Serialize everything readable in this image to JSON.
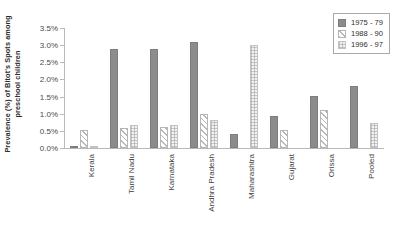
{
  "chart_data": {
    "type": "bar",
    "title": "",
    "xlabel": "",
    "ylabel": "Prevalence (%) of Bitot's Spots among\npreschool children",
    "ylim": [
      0,
      3.5
    ],
    "ytick_labels": [
      "0.0%",
      "0.5%",
      "1.0%",
      "1.5%",
      "2.0%",
      "2.5%",
      "3.0%",
      "3.5%"
    ],
    "ytick_values": [
      0,
      0.5,
      1.0,
      1.5,
      2.0,
      2.5,
      3.0,
      3.5
    ],
    "grid": false,
    "legend_position": "top-right",
    "categories": [
      "Kerala",
      "Tamil Nadu",
      "Karnataka",
      "Andhra Pradesh",
      "Maharashtra",
      "Gujarat",
      "Orissa",
      "Pooled"
    ],
    "series": [
      {
        "name": "1975 - 79",
        "color": "#8c8c8c",
        "fill": "solid-gray",
        "values": [
          0.07,
          2.89,
          2.9,
          3.1,
          0.4,
          0.92,
          1.51,
          1.82
        ]
      },
      {
        "name": "1988 - 90",
        "color": "#ffffff",
        "fill": "diagonal-hatch",
        "values": [
          0.52,
          0.59,
          0.6,
          1.0,
          0.0,
          0.52,
          1.1,
          0.0
        ]
      },
      {
        "name": "1996 - 97",
        "color": "#f2f2f2",
        "fill": "checker-dot",
        "values": [
          0.07,
          0.68,
          0.66,
          0.82,
          3.01,
          0.0,
          0.0,
          0.73
        ]
      }
    ]
  },
  "legend": {
    "entries": [
      {
        "label": "1975 - 79",
        "swatch": "solid-gray-swatch"
      },
      {
        "label": "1988 - 90",
        "swatch": "hatched-swatch"
      },
      {
        "label": "1996 - 97",
        "swatch": "checkered-swatch"
      }
    ]
  }
}
